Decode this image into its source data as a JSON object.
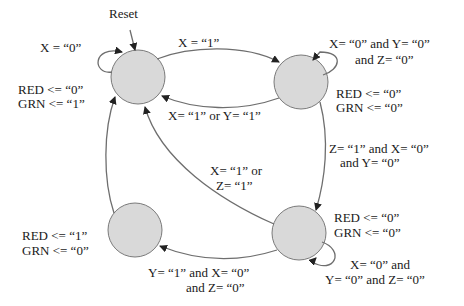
{
  "diagram": {
    "type": "state-machine",
    "reset_label": "Reset",
    "states": [
      {
        "id": "s0",
        "outputs": [
          "RED <=  “0”",
          "GRN <=  “1”"
        ]
      },
      {
        "id": "s1",
        "outputs": [
          "RED <=  “0”",
          "GRN <=  “0”"
        ]
      },
      {
        "id": "s2",
        "outputs": [
          "RED <=  “0”",
          "GRN <=  “0”"
        ]
      },
      {
        "id": "s3",
        "outputs": [
          "RED <=  “1”",
          "GRN <=  “0”"
        ]
      }
    ],
    "transitions": {
      "s0_self": "X = “0”",
      "s0_to_s1": "X =  “1”",
      "s1_self": [
        "X= “0”  and Y= “0”",
        "and Z= “0”"
      ],
      "s1_to_s0": "X= “1”  or Y= “1”",
      "s1_to_s2": [
        "Z= “1”  and X= “0”",
        "and Y= “0”"
      ],
      "s2_to_s0": [
        "X= “1”  or",
        "Z= “1”"
      ],
      "s2_self": [
        "X= “0”  and",
        "Y= “0”  and Z= “0”"
      ],
      "s2_to_s3": [
        "Y= “1”  and X= “0”",
        "and Z= “0”"
      ]
    },
    "colors": {
      "state_fill": "#d9d9d9",
      "state_stroke": "#7a7a7a",
      "edge": "#6e6e6e"
    }
  }
}
